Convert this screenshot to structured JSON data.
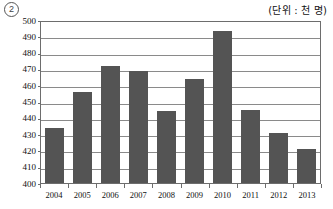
{
  "header": {
    "item_number": "2",
    "unit_note": "(단위 : 천 명)"
  },
  "chart_data": {
    "type": "bar",
    "title": "",
    "xlabel": "",
    "ylabel": "",
    "unit": "천 명",
    "categories": [
      "2004",
      "2005",
      "2006",
      "2007",
      "2008",
      "2009",
      "2010",
      "2011",
      "2012",
      "2013"
    ],
    "values": [
      434,
      456,
      472,
      469,
      444,
      464,
      493,
      445,
      431,
      421
    ],
    "ylim": [
      400,
      500
    ],
    "ytick_step": 10,
    "yticks": [
      500,
      490,
      480,
      470,
      460,
      450,
      440,
      430,
      420,
      410,
      400
    ],
    "grid": true,
    "legend": "none",
    "bar_color": "#545454",
    "frame_color": "#6d6d6d",
    "grid_color": "#8a8a8a"
  }
}
